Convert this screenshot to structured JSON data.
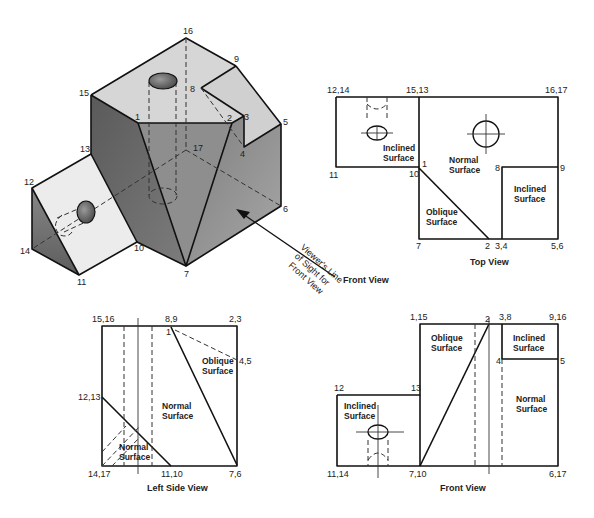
{
  "isometric": {
    "vertex_labels": {
      "v1": "1",
      "v2": "2",
      "v3": "3",
      "v4": "4",
      "v5": "5",
      "v6": "6",
      "v7": "7",
      "v8": "8",
      "v9": "9",
      "v10": "10",
      "v11": "11",
      "v12": "12",
      "v13": "13",
      "v14": "14",
      "v15": "15",
      "v16": "16",
      "v17": "17"
    },
    "line_of_sight": [
      "Viewer's Line",
      "of Sight for",
      "Front View"
    ],
    "front_view_pointer": "Front View",
    "colors": {
      "top_face": "#d8d8d8",
      "dark_face": "#6e6e6e",
      "mid_face": "#8c8c8c",
      "light_face": "#e8e8e8"
    }
  },
  "top_view": {
    "caption": "Top View",
    "vertex_labels": {
      "a": "12,14",
      "b": "15,13",
      "c": "16,17",
      "d": "11",
      "e": "10",
      "f": "1",
      "g": "8",
      "h": "9",
      "i": "7",
      "j": "2",
      "k": "3,4",
      "l": "5,6"
    },
    "surfaces": {
      "inclined_left": [
        "Inclined",
        "Surface"
      ],
      "normal": [
        "Normal",
        "Surface"
      ],
      "inclined_right": [
        "Inclined",
        "Surface"
      ],
      "oblique": [
        "Oblique",
        "Surface"
      ]
    }
  },
  "left_side_view": {
    "caption": "Left Side View",
    "vertex_labels": {
      "a": "15,16",
      "b": "8,9",
      "c": "2,3",
      "d": "1",
      "e": "4,5",
      "f": "12,13",
      "g": "14,17",
      "h": "11,10",
      "i": "7,6"
    },
    "surfaces": {
      "oblique": [
        "Oblique",
        "Surface"
      ],
      "normal_center": [
        "Normal",
        "Surface"
      ],
      "normal_bottom": [
        "Normal",
        "Surface"
      ]
    }
  },
  "front_view": {
    "caption": "Front View",
    "vertex_labels": {
      "a": "1,15",
      "b": "2",
      "c": "3,8",
      "d": "9,16",
      "e": "4",
      "f": "5",
      "g": "12",
      "h": "13",
      "i": "11,14",
      "j": "7,10",
      "k": "6,17"
    },
    "surfaces": {
      "oblique": [
        "Oblique",
        "Surface"
      ],
      "inclined_top": [
        "Inclined",
        "Surface"
      ],
      "normal": [
        "Normal",
        "Surface"
      ],
      "inclined_left": [
        "Inclined",
        "Surface"
      ]
    }
  }
}
